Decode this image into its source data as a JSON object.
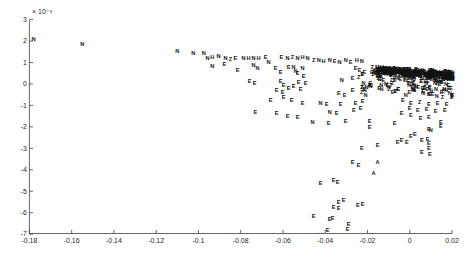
{
  "figure": {
    "background": "#ffffff",
    "marker_color": "#111111",
    "axis_color": "#262626"
  },
  "chart_data": {
    "type": "scatter",
    "title": "",
    "xlabel": "",
    "ylabel": "",
    "xlim": [
      -0.18,
      0.02
    ],
    "ylim_e3": [
      -7,
      3
    ],
    "y_exponent_label": "× 10⁻³",
    "x_ticks": [
      -0.18,
      -0.16,
      -0.14,
      -0.12,
      -0.1,
      -0.08,
      -0.06,
      -0.04,
      -0.02,
      0,
      0.02
    ],
    "x_tick_labels": [
      "-0.18",
      "-0.16",
      "-0.14",
      "-0.12",
      "-0.1",
      "-0.08",
      "-0.06",
      "-0.04",
      "-0.02",
      "0",
      "0.02"
    ],
    "y_ticks_e3": [
      3,
      2,
      1,
      0,
      -1,
      -2,
      -3,
      -4,
      -5,
      -6,
      -7
    ],
    "y_tick_labels": [
      "3",
      "2",
      "1",
      "0",
      "-1",
      "-2",
      "-3",
      "-4",
      "-5",
      "-6",
      "-7"
    ],
    "grid": false,
    "legend": null,
    "marker_style": "letter-labels",
    "points": [
      [
        -0.178,
        2.1,
        "N"
      ],
      [
        -0.155,
        1.87,
        "N"
      ],
      [
        -0.11,
        1.54,
        "N"
      ],
      [
        -0.1025,
        1.45,
        "N"
      ],
      [
        -0.0975,
        1.43,
        "N"
      ],
      [
        -0.0957,
        1.21,
        "N"
      ],
      [
        -0.0934,
        1.27,
        "H"
      ],
      [
        -0.0905,
        1.31,
        "N"
      ],
      [
        -0.0872,
        1.21,
        "N"
      ],
      [
        -0.0848,
        1.16,
        "Z"
      ],
      [
        -0.0825,
        1.21,
        "E"
      ],
      [
        -0.0787,
        1.23,
        "N"
      ],
      [
        -0.0763,
        1.19,
        "H"
      ],
      [
        -0.0739,
        1.21,
        "N"
      ],
      [
        -0.0716,
        1.23,
        "H"
      ],
      [
        -0.0682,
        1.26,
        "E"
      ],
      [
        -0.0668,
        1.03,
        "N"
      ],
      [
        -0.0607,
        1.26,
        "E"
      ],
      [
        -0.0578,
        1.21,
        "N"
      ],
      [
        -0.0555,
        1.26,
        "Z"
      ],
      [
        -0.0531,
        1.21,
        "N"
      ],
      [
        -0.0507,
        1.26,
        "H"
      ],
      [
        -0.0484,
        1.21,
        "N"
      ],
      [
        -0.0455,
        1.12,
        "Z"
      ],
      [
        -0.0431,
        1.12,
        "N"
      ],
      [
        -0.0408,
        1.07,
        "H"
      ],
      [
        -0.0379,
        1.12,
        "N"
      ],
      [
        -0.0355,
        1.07,
        "E"
      ],
      [
        -0.0332,
        1.03,
        "N"
      ],
      [
        -0.0303,
        1.12,
        "N"
      ],
      [
        -0.028,
        1.03,
        "E"
      ],
      [
        -0.0251,
        1.12,
        "H"
      ],
      [
        -0.0227,
        1.07,
        "N"
      ],
      [
        -0.0934,
        0.84,
        "N"
      ],
      [
        -0.0877,
        0.93,
        "E"
      ],
      [
        -0.0815,
        0.65,
        "E"
      ],
      [
        -0.0739,
        0.89,
        "N"
      ],
      [
        -0.072,
        0.75,
        "N"
      ],
      [
        -0.0635,
        0.75,
        "E"
      ],
      [
        -0.0611,
        0.56,
        "E"
      ],
      [
        -0.0573,
        0.79,
        "E"
      ],
      [
        -0.055,
        0.79,
        "N"
      ],
      [
        -0.054,
        0.61,
        "N"
      ],
      [
        -0.0507,
        0.75,
        "N"
      ],
      [
        -0.0531,
        0.51,
        "E"
      ],
      [
        -0.0502,
        0.37,
        "E"
      ],
      [
        -0.0256,
        0.75,
        "E"
      ],
      [
        -0.0237,
        0.65,
        "E"
      ],
      [
        -0.0322,
        0.19,
        "N"
      ],
      [
        -0.027,
        0.28,
        "E"
      ],
      [
        -0.0242,
        0.33,
        "Z"
      ],
      [
        -0.0758,
        0.14,
        "E"
      ],
      [
        -0.0734,
        0.05,
        "E"
      ],
      [
        -0.0611,
        0.14,
        "E"
      ],
      [
        -0.0526,
        0.09,
        "E"
      ],
      [
        -0.0493,
        0.05,
        "E"
      ],
      [
        -0.0597,
        -0.05,
        "E"
      ],
      [
        -0.0573,
        -0.19,
        "E"
      ],
      [
        -0.055,
        -0.09,
        "E"
      ],
      [
        -0.0517,
        -0.23,
        "E"
      ],
      [
        -0.063,
        -0.28,
        "E"
      ],
      [
        -0.0602,
        -0.37,
        "E"
      ],
      [
        -0.0336,
        -0.42,
        "E"
      ],
      [
        -0.0308,
        -0.51,
        "E"
      ],
      [
        -0.027,
        -0.28,
        "E"
      ],
      [
        -0.0597,
        -0.61,
        "E"
      ],
      [
        -0.0658,
        -0.75,
        "E"
      ],
      [
        -0.0559,
        -0.75,
        "E"
      ],
      [
        -0.0507,
        -0.89,
        "E"
      ],
      [
        -0.0422,
        -0.89,
        "N"
      ],
      [
        -0.0393,
        -0.93,
        "E"
      ],
      [
        -0.0327,
        -0.93,
        "E"
      ],
      [
        -0.0256,
        -0.89,
        "E"
      ],
      [
        -0.0223,
        -0.79,
        "E"
      ],
      [
        -0.073,
        -1.31,
        "E"
      ],
      [
        -0.063,
        -1.36,
        "E"
      ],
      [
        -0.0578,
        -1.5,
        "E"
      ],
      [
        -0.0531,
        -1.54,
        "E"
      ],
      [
        -0.046,
        -1.78,
        "N"
      ],
      [
        -0.0379,
        -1.31,
        "N"
      ],
      [
        -0.0346,
        -1.36,
        "E"
      ],
      [
        -0.0265,
        -1.21,
        "E"
      ],
      [
        -0.0232,
        -1.12,
        "E"
      ],
      [
        -0.0303,
        -1.73,
        "E"
      ],
      [
        -0.0384,
        -1.82,
        "E"
      ],
      [
        -0.019,
        -1.73,
        "E"
      ],
      [
        -0.019,
        -2.01,
        "E"
      ],
      [
        -0.0071,
        -1.82,
        "E"
      ],
      [
        -0.0227,
        -2.99,
        "E"
      ],
      [
        -0.0152,
        -2.85,
        "E"
      ],
      [
        -0.027,
        -3.64,
        "E"
      ],
      [
        -0.0242,
        -3.79,
        "E"
      ],
      [
        -0.0152,
        -3.64,
        "A"
      ],
      [
        -0.0171,
        -4.16,
        "A"
      ],
      [
        -0.0422,
        -4.63,
        "E"
      ],
      [
        -0.036,
        -4.49,
        "E"
      ],
      [
        -0.0341,
        -4.58,
        "E"
      ],
      [
        -0.0337,
        -5.51,
        "E"
      ],
      [
        -0.0313,
        -5.42,
        "E"
      ],
      [
        -0.0246,
        -5.65,
        "E"
      ],
      [
        -0.0223,
        -5.61,
        "E"
      ],
      [
        -0.036,
        -5.75,
        "E"
      ],
      [
        -0.0337,
        -5.8,
        "E"
      ],
      [
        -0.0455,
        -6.17,
        "E"
      ],
      [
        -0.0379,
        -6.31,
        "E"
      ],
      [
        -0.0365,
        -6.26,
        "E"
      ],
      [
        -0.0389,
        -6.82,
        "E"
      ],
      [
        -0.0294,
        -6.78,
        "E"
      ],
      [
        -0.0289,
        -6.54,
        "E"
      ],
      [
        -0.0033,
        -0.75,
        "E"
      ],
      [
        0.0005,
        -0.89,
        "E"
      ],
      [
        0.0047,
        -0.84,
        "Z"
      ],
      [
        0.009,
        -0.93,
        "E"
      ],
      [
        0.0132,
        -0.89,
        "E"
      ],
      [
        0.0175,
        -0.93,
        "E"
      ],
      [
        0.0,
        -1.12,
        "E"
      ],
      [
        0.0038,
        -1.21,
        "E"
      ],
      [
        0.008,
        -1.17,
        "E"
      ],
      [
        0.0123,
        -1.26,
        "E"
      ],
      [
        0.0166,
        -1.21,
        "E"
      ],
      [
        0.0005,
        -1.45,
        "E"
      ],
      [
        -0.0038,
        -1.35,
        "E"
      ],
      [
        0.0052,
        -1.59,
        "E"
      ],
      [
        0.009,
        -1.54,
        "E"
      ],
      [
        0.0147,
        -1.78,
        "E"
      ],
      [
        0.0024,
        -2.34,
        "E"
      ],
      [
        0.009,
        -2.1,
        "E"
      ],
      [
        0.01,
        -2.15,
        "N"
      ],
      [
        0.0147,
        -1.97,
        "E"
      ],
      [
        0.0005,
        -2.43,
        "E"
      ],
      [
        -0.0014,
        -2.71,
        "E"
      ],
      [
        0.0057,
        -2.62,
        "E"
      ],
      [
        0.0085,
        -2.57,
        "E"
      ],
      [
        0.009,
        -2.76,
        "E"
      ],
      [
        0.009,
        -2.99,
        "E"
      ],
      [
        -0.0057,
        -2.71,
        "E"
      ],
      [
        -0.0038,
        -2.62,
        "E"
      ],
      [
        0.0057,
        -3.18,
        "E"
      ],
      [
        0.0095,
        -3.27,
        "E"
      ]
    ],
    "dense_clusters": [
      {
        "name": "band-core",
        "kind": "band",
        "seed": 42,
        "count": 300,
        "x_min": -0.017,
        "x_max": 0.0205,
        "y_top_left": 0.82,
        "y_top_right": 0.58,
        "thickness": 0.3,
        "letters": [
          "E",
          "N",
          "Z",
          "H"
        ]
      },
      {
        "name": "band-halo",
        "kind": "halo",
        "seed": 7,
        "count": 140,
        "x_min": -0.0155,
        "x_max": 0.0205,
        "y_top_left": 0.82,
        "y_top_right": 0.58,
        "thickness": 0.3,
        "depth": 0.95,
        "letters": [
          "E",
          "N",
          "Z",
          "E"
        ]
      },
      {
        "name": "left-fringe",
        "kind": "box",
        "seed": 11,
        "count": 18,
        "x_min": -0.023,
        "x_max": -0.016,
        "y_min": -0.7,
        "y_max": 0.9,
        "letters": [
          "E",
          "N",
          "Z"
        ]
      }
    ]
  }
}
